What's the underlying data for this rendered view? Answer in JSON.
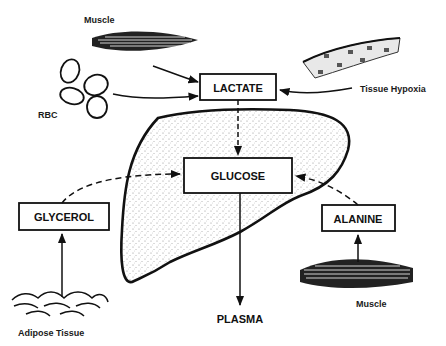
{
  "diagram": {
    "type": "metabolic-pathway",
    "nodes": {
      "lactate": {
        "label": "LACTATE"
      },
      "glucose": {
        "label": "GLUCOSE"
      },
      "glycerol": {
        "label": "GLYCEROL"
      },
      "alanine": {
        "label": "ALANINE"
      },
      "plasma": {
        "label": "PLASMA"
      }
    },
    "sources": {
      "muscle_top": {
        "label": "Muscle"
      },
      "rbc": {
        "label": "RBC"
      },
      "tissue_hypoxia": {
        "label": "Tissue Hypoxia"
      },
      "adipose": {
        "label": "Adipose Tissue"
      },
      "muscle_bottom": {
        "label": "Muscle"
      }
    },
    "edges": [
      {
        "from": "Muscle",
        "to": "LACTATE",
        "style": "solid"
      },
      {
        "from": "RBC",
        "to": "LACTATE",
        "style": "solid"
      },
      {
        "from": "Tissue Hypoxia",
        "to": "LACTATE",
        "style": "solid"
      },
      {
        "from": "LACTATE",
        "to": "GLUCOSE",
        "style": "dashed"
      },
      {
        "from": "GLYCEROL",
        "to": "GLUCOSE",
        "style": "dashed"
      },
      {
        "from": "ALANINE",
        "to": "GLUCOSE",
        "style": "dashed"
      },
      {
        "from": "Adipose Tissue",
        "to": "GLYCEROL",
        "style": "solid"
      },
      {
        "from": "Muscle",
        "to": "ALANINE",
        "style": "solid"
      },
      {
        "from": "GLUCOSE",
        "to": "PLASMA",
        "style": "solid"
      }
    ],
    "colors": {
      "ink": "#111111",
      "background": "#ffffff",
      "stipple": "#9a9a9a"
    }
  }
}
